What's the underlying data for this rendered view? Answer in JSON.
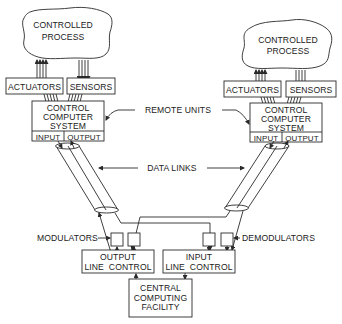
{
  "diagram": {
    "left_unit": {
      "process": [
        "CONTROLLED",
        "PROCESS"
      ],
      "actuators": "ACTUATORS",
      "sensors": "SENSORS",
      "computer": [
        "CONTROL",
        "COMPUTER",
        "SYSTEM"
      ],
      "input": "INPUT",
      "output": "OUTPUT"
    },
    "right_unit": {
      "process": [
        "CONTROLLED",
        "PROCESS"
      ],
      "actuators": "ACTUATORS",
      "sensors": "SENSORS",
      "computer": [
        "CONTROL",
        "COMPUTER",
        "SYSTEM"
      ],
      "input": "INPUT",
      "output": "OUTPUT"
    },
    "labels": {
      "remote_units": "REMOTE UNITS",
      "data_links": "DATA LINKS",
      "modulators": "MODULATORS",
      "demodulators": "DEMODULATORS"
    },
    "output_line_control": [
      "OUTPUT",
      "LINE  CONTROL"
    ],
    "input_line_control": [
      "INPUT",
      "LINE  CONTROL"
    ],
    "central": [
      "CENTRAL",
      "COMPUTING",
      "FACILITY"
    ]
  }
}
